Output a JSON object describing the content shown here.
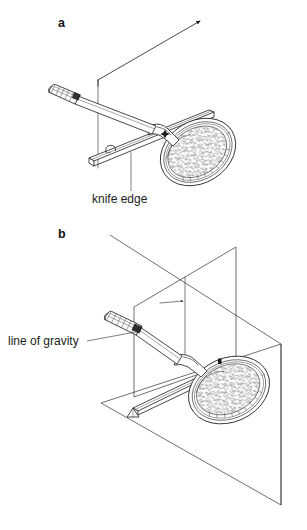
{
  "figure": {
    "background_color": "#ffffff",
    "ink_color": "#1b1b1b",
    "panels": [
      {
        "id": "a",
        "letter": "a",
        "description": "Tennis racket balanced on a knife edge with a vertical reference line and an inclined arrow",
        "labels": [
          {
            "name": "knife-edge",
            "text": "knife edge"
          }
        ]
      },
      {
        "id": "b",
        "letter": "b",
        "description": "Tennis racket suspended from a knife edge with a vertical plane showing the line of gravity",
        "labels": [
          {
            "name": "line-of-gravity",
            "text": "line of gravity"
          }
        ]
      }
    ],
    "caption": ""
  },
  "panel_a": {
    "letter": "a",
    "knife_edge_label": "knife edge"
  },
  "panel_b": {
    "letter": "b",
    "line_of_gravity_label": "line of gravity"
  },
  "caption": {
    "text": ""
  }
}
